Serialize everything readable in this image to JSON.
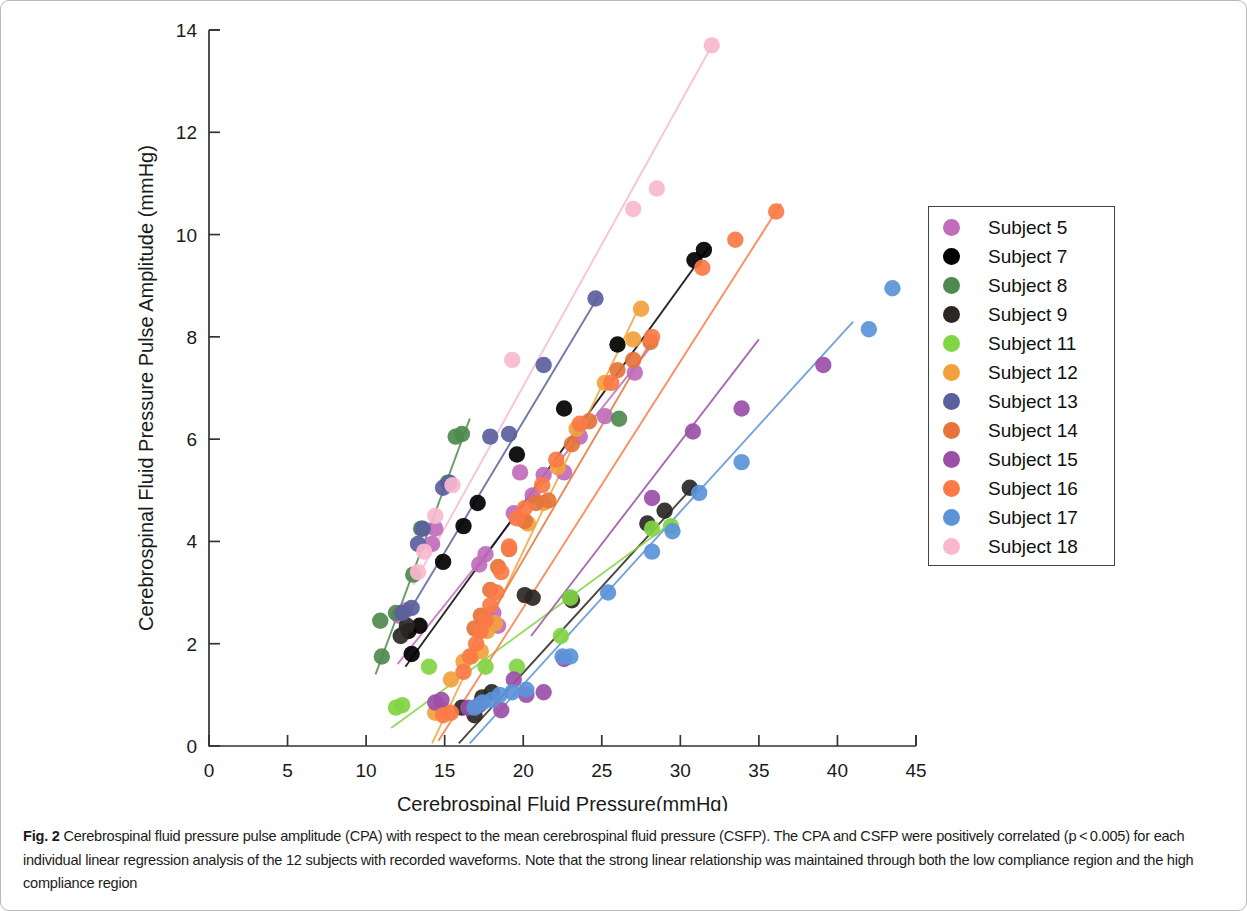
{
  "figure": {
    "label": "Fig. 2",
    "caption": "Cerebrospinal fluid pressure pulse amplitude (CPA) with respect to the mean cerebrospinal fluid pressure (CSFP). The CPA and CSFP were positively correlated (p < 0.005) for each individual linear regression analysis of the 12 subjects with recorded waveforms. Note that the strong linear relationship was maintained through both the low compliance region and the high compliance region"
  },
  "legend": {
    "position": "right",
    "entries": [
      {
        "label": "Subject 5",
        "color": "#c06cbb"
      },
      {
        "label": "Subject 7",
        "color": "#000000"
      },
      {
        "label": "Subject 8",
        "color": "#4e8a4e"
      },
      {
        "label": "Subject 9",
        "color": "#2a2724"
      },
      {
        "label": "Subject 11",
        "color": "#82d443"
      },
      {
        "label": "Subject 12",
        "color": "#f2a23c"
      },
      {
        "label": "Subject 13",
        "color": "#5a5f9e"
      },
      {
        "label": "Subject 14",
        "color": "#e4743a"
      },
      {
        "label": "Subject 15",
        "color": "#9b4fa8"
      },
      {
        "label": "Subject 16",
        "color": "#fb7a46"
      },
      {
        "label": "Subject 17",
        "color": "#5b92d8"
      },
      {
        "label": "Subject 18",
        "color": "#f9b8ce"
      }
    ]
  },
  "chart_data": {
    "type": "scatter",
    "title": "",
    "xlabel": "Cerebrospinal Fluid Pressure(mmHg)",
    "ylabel": "Cerebrospinal Fluid Pressure Pulse Amplitude (mmHg)",
    "xlim": [
      0,
      45
    ],
    "ylim": [
      0,
      14
    ],
    "xticks": [
      0,
      5,
      10,
      15,
      20,
      25,
      30,
      35,
      40,
      45
    ],
    "yticks": [
      0,
      2,
      4,
      6,
      8,
      10,
      12,
      14
    ],
    "grid": false,
    "series": [
      {
        "name": "Subject 5",
        "color": "#c06cbb",
        "points": [
          [
            12.1,
            2.55
          ],
          [
            12.5,
            2.65
          ],
          [
            14.2,
            3.95
          ],
          [
            14.4,
            4.25
          ],
          [
            17.2,
            3.55
          ],
          [
            17.6,
            3.75
          ],
          [
            18.1,
            2.6
          ],
          [
            18.4,
            2.35
          ],
          [
            19.4,
            4.55
          ],
          [
            19.8,
            5.35
          ],
          [
            20.6,
            4.9
          ],
          [
            21.3,
            5.3
          ],
          [
            22.6,
            5.35
          ],
          [
            23.6,
            6.05
          ],
          [
            25.2,
            6.45
          ],
          [
            27.1,
            7.3
          ]
        ],
        "fit": {
          "x0": 12.0,
          "y0": 1.6,
          "x1": 28.5,
          "y1": 7.95
        }
      },
      {
        "name": "Subject 7",
        "color": "#000000",
        "points": [
          [
            12.7,
            2.25
          ],
          [
            12.9,
            1.8
          ],
          [
            13.4,
            2.35
          ],
          [
            14.9,
            3.6
          ],
          [
            16.2,
            4.3
          ],
          [
            17.1,
            4.75
          ],
          [
            19.6,
            5.7
          ],
          [
            22.6,
            6.6
          ],
          [
            26.0,
            7.85
          ],
          [
            30.9,
            9.5
          ],
          [
            31.5,
            9.7
          ]
        ],
        "fit": {
          "x0": 12.5,
          "y0": 1.55,
          "x1": 31.8,
          "y1": 9.75
        }
      },
      {
        "name": "Subject 8",
        "color": "#4e8a4e",
        "points": [
          [
            10.9,
            2.45
          ],
          [
            11.0,
            1.75
          ],
          [
            11.9,
            2.6
          ],
          [
            13.0,
            3.35
          ],
          [
            13.5,
            4.25
          ],
          [
            15.2,
            5.15
          ],
          [
            15.7,
            6.05
          ],
          [
            16.1,
            6.1
          ],
          [
            23.0,
            2.9
          ],
          [
            26.1,
            6.4
          ]
        ],
        "fit": {
          "x0": 10.6,
          "y0": 1.4,
          "x1": 16.6,
          "y1": 6.4
        }
      },
      {
        "name": "Subject 9",
        "color": "#2a2724",
        "points": [
          [
            12.2,
            2.15
          ],
          [
            12.6,
            2.35
          ],
          [
            16.1,
            0.75
          ],
          [
            16.9,
            0.6
          ],
          [
            17.4,
            0.95
          ],
          [
            18.0,
            1.05
          ],
          [
            20.1,
            2.95
          ],
          [
            20.6,
            2.9
          ],
          [
            23.1,
            2.85
          ],
          [
            27.9,
            4.35
          ],
          [
            29.0,
            4.6
          ],
          [
            30.6,
            5.05
          ]
        ],
        "fit": {
          "x0": 15.9,
          "y0": 0.05,
          "x1": 30.9,
          "y1": 5.1
        }
      },
      {
        "name": "Subject 11",
        "color": "#82d443",
        "points": [
          [
            11.9,
            0.75
          ],
          [
            12.3,
            0.8
          ],
          [
            14.0,
            1.55
          ],
          [
            17.6,
            1.55
          ],
          [
            19.6,
            1.55
          ],
          [
            22.4,
            2.15
          ],
          [
            23.0,
            2.9
          ],
          [
            28.2,
            4.25
          ],
          [
            29.4,
            4.3
          ]
        ],
        "fit": {
          "x0": 11.6,
          "y0": 0.35,
          "x1": 29.6,
          "y1": 4.4
        }
      },
      {
        "name": "Subject 12",
        "color": "#f2a23c",
        "points": [
          [
            14.4,
            0.65
          ],
          [
            14.9,
            0.7
          ],
          [
            15.4,
            1.3
          ],
          [
            16.2,
            1.65
          ],
          [
            16.7,
            1.75
          ],
          [
            17.3,
            1.85
          ],
          [
            17.7,
            2.25
          ],
          [
            18.2,
            2.4
          ],
          [
            20.3,
            4.35
          ],
          [
            21.3,
            4.75
          ],
          [
            22.2,
            5.45
          ],
          [
            23.4,
            6.2
          ],
          [
            25.2,
            7.1
          ],
          [
            27.0,
            7.95
          ],
          [
            27.5,
            8.55
          ]
        ],
        "fit": {
          "x0": 14.2,
          "y0": 0.05,
          "x1": 27.4,
          "y1": 8.6
        }
      },
      {
        "name": "Subject 13",
        "color": "#5a5f9e",
        "points": [
          [
            12.3,
            2.6
          ],
          [
            12.9,
            2.7
          ],
          [
            13.3,
            3.95
          ],
          [
            13.6,
            4.25
          ],
          [
            14.9,
            5.05
          ],
          [
            15.3,
            5.15
          ],
          [
            17.9,
            6.05
          ],
          [
            19.1,
            6.1
          ],
          [
            21.3,
            7.45
          ],
          [
            24.6,
            8.75
          ]
        ],
        "fit": {
          "x0": 11.9,
          "y0": 2.2,
          "x1": 24.8,
          "y1": 8.8
        }
      },
      {
        "name": "Subject 14",
        "color": "#e4743a",
        "points": [
          [
            16.9,
            2.3
          ],
          [
            17.3,
            2.55
          ],
          [
            17.9,
            3.05
          ],
          [
            18.4,
            3.5
          ],
          [
            19.1,
            3.85
          ],
          [
            20.1,
            4.4
          ],
          [
            20.8,
            4.75
          ],
          [
            21.6,
            4.8
          ],
          [
            23.1,
            5.9
          ],
          [
            24.2,
            6.35
          ],
          [
            26.0,
            7.35
          ],
          [
            27.0,
            7.55
          ],
          [
            28.1,
            7.9
          ]
        ],
        "fit": {
          "x0": 16.4,
          "y0": 1.75,
          "x1": 28.4,
          "y1": 8.05
        }
      },
      {
        "name": "Subject 15",
        "color": "#9b4fa8",
        "points": [
          [
            14.4,
            0.85
          ],
          [
            14.8,
            0.9
          ],
          [
            16.5,
            0.75
          ],
          [
            17.2,
            0.8
          ],
          [
            18.6,
            0.7
          ],
          [
            19.4,
            1.3
          ],
          [
            20.2,
            1.0
          ],
          [
            21.3,
            1.05
          ],
          [
            22.6,
            1.7
          ],
          [
            28.2,
            4.85
          ],
          [
            30.8,
            6.15
          ],
          [
            33.9,
            6.6
          ],
          [
            39.1,
            7.45
          ]
        ],
        "fit": {
          "x0": 20.5,
          "y0": 2.15,
          "x1": 35.0,
          "y1": 7.95
        }
      },
      {
        "name": "Subject 16",
        "color": "#fb7a46",
        "points": [
          [
            14.9,
            0.6
          ],
          [
            15.4,
            0.65
          ],
          [
            16.2,
            1.45
          ],
          [
            16.6,
            1.75
          ],
          [
            17.0,
            2.0
          ],
          [
            17.3,
            2.25
          ],
          [
            17.6,
            2.45
          ],
          [
            17.9,
            2.75
          ],
          [
            18.3,
            3.0
          ],
          [
            18.6,
            3.4
          ],
          [
            19.1,
            3.9
          ],
          [
            19.6,
            4.45
          ],
          [
            20.1,
            4.65
          ],
          [
            21.2,
            5.1
          ],
          [
            22.1,
            5.6
          ],
          [
            23.6,
            6.3
          ],
          [
            25.6,
            7.1
          ],
          [
            28.2,
            8.0
          ],
          [
            31.4,
            9.35
          ],
          [
            33.5,
            9.9
          ],
          [
            36.1,
            10.45
          ]
        ],
        "fit": {
          "x0": 14.6,
          "y0": 0.1,
          "x1": 36.4,
          "y1": 10.6
        }
      },
      {
        "name": "Subject 17",
        "color": "#5b92d8",
        "points": [
          [
            16.9,
            0.75
          ],
          [
            17.4,
            0.85
          ],
          [
            18.0,
            0.9
          ],
          [
            18.5,
            1.0
          ],
          [
            19.3,
            1.05
          ],
          [
            20.2,
            1.1
          ],
          [
            22.5,
            1.75
          ],
          [
            23.0,
            1.75
          ],
          [
            25.4,
            3.0
          ],
          [
            28.2,
            3.8
          ],
          [
            29.5,
            4.2
          ],
          [
            31.2,
            4.95
          ],
          [
            33.9,
            5.55
          ],
          [
            42.0,
            8.15
          ],
          [
            43.5,
            8.95
          ]
        ],
        "fit": {
          "x0": 16.6,
          "y0": 0.05,
          "x1": 41.0,
          "y1": 8.3
        }
      },
      {
        "name": "Subject 18",
        "color": "#f9b8ce",
        "points": [
          [
            13.3,
            3.4
          ],
          [
            13.7,
            3.8
          ],
          [
            14.4,
            4.5
          ],
          [
            15.5,
            5.1
          ],
          [
            19.3,
            7.55
          ],
          [
            27.0,
            10.5
          ],
          [
            28.5,
            10.9
          ],
          [
            32.0,
            13.7
          ]
        ],
        "fit": {
          "x0": 13.0,
          "y0": 3.15,
          "x1": 32.2,
          "y1": 13.8
        }
      }
    ]
  }
}
